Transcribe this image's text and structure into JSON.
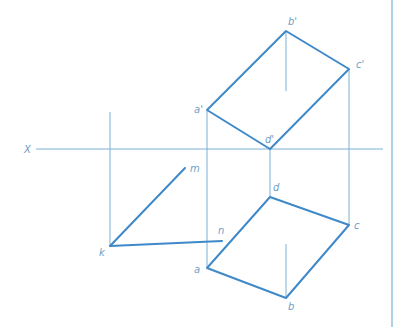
{
  "diagram": {
    "type": "orthographic-projection",
    "colors": {
      "line": "#3f89c9",
      "projector": "#7aafd6",
      "label": "#6f9fc8",
      "border": "#8fc0e0"
    },
    "axis": {
      "label": "X"
    },
    "labels": {
      "a_prime": "a'",
      "b_prime": "b'",
      "c_prime": "c'",
      "d_prime": "d'",
      "a": "a",
      "b": "b",
      "c": "c",
      "d": "d",
      "k": "k",
      "m": "m",
      "n": "n"
    }
  }
}
